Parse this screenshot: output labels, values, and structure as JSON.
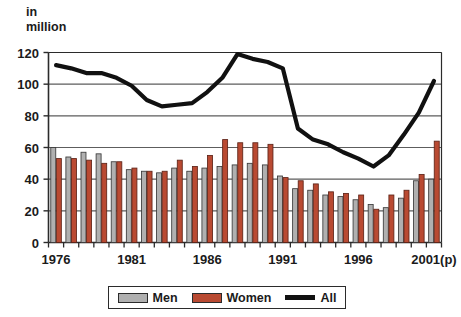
{
  "chart_data": {
    "type": "bar",
    "title": "",
    "subtitle": "",
    "ylabel": "in\nmillion",
    "xlabel": "",
    "ylim": [
      0,
      120
    ],
    "yticks": [
      0,
      20,
      40,
      60,
      80,
      100,
      120
    ],
    "grid": true,
    "legend_position": "bottom",
    "x": [
      1976,
      1977,
      1978,
      1979,
      1980,
      1981,
      1982,
      1983,
      1984,
      1985,
      1986,
      1987,
      1988,
      1989,
      1990,
      1991,
      1992,
      1993,
      1994,
      1995,
      1996,
      1997,
      1998,
      1999,
      2000,
      2001
    ],
    "xtick_labels": [
      "1976",
      "1981",
      "1986",
      "1991",
      "1996",
      "2001(p)"
    ],
    "xtick_values": [
      1976,
      1981,
      1986,
      1991,
      1996,
      2001
    ],
    "series": [
      {
        "name": "Men",
        "type": "bar",
        "color": "#b0b0b0",
        "values": [
          60,
          54,
          57,
          56,
          51,
          46,
          45,
          44,
          47,
          45,
          47,
          48,
          49,
          50,
          49,
          42,
          34,
          33,
          30,
          29,
          27,
          24,
          22,
          28,
          39,
          40
        ]
      },
      {
        "name": "Women",
        "type": "bar",
        "color": "#b94a32",
        "values": [
          53,
          53,
          52,
          50,
          51,
          47,
          45,
          45,
          52,
          48,
          55,
          65,
          63,
          63,
          62,
          41,
          39,
          37,
          32,
          31,
          30,
          21,
          30,
          33,
          43,
          64
        ]
      },
      {
        "name": "All",
        "type": "line",
        "color": "#111111",
        "values": [
          112,
          110,
          107,
          107,
          104,
          99,
          90,
          86,
          87,
          88,
          95,
          104,
          119,
          116,
          114,
          110,
          72,
          65,
          62,
          57,
          53,
          48,
          55,
          68,
          82,
          102
        ]
      }
    ]
  },
  "legend": {
    "items": [
      {
        "label": "Men",
        "color": "#b0b0b0",
        "kind": "bar"
      },
      {
        "label": "Women",
        "color": "#b94a32",
        "kind": "bar"
      },
      {
        "label": "All",
        "color": "#111111",
        "kind": "line"
      }
    ]
  },
  "axes": {
    "y_unit_line1": "in",
    "y_unit_line2": "million"
  }
}
